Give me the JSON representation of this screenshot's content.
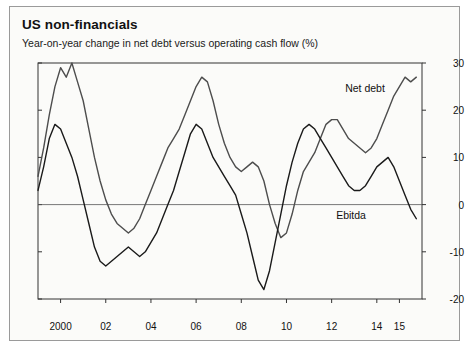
{
  "card": {
    "title": "US non-financials",
    "subtitle": "Year-on-year change in net debt versus operating cash flow (%)"
  },
  "chart_data": {
    "type": "line",
    "title": "US non-financials",
    "subtitle": "Year-on-year change in net debt versus operating cash flow (%)",
    "xlabel": "",
    "ylabel": "%",
    "ylim": [
      -20,
      30
    ],
    "yticks": [
      -20,
      -10,
      0,
      10,
      20,
      30
    ],
    "xlim": [
      1999.0,
      2016.0
    ],
    "xticks": [
      2000,
      2002,
      2004,
      2006,
      2008,
      2010,
      2012,
      2014,
      2015
    ],
    "xticklabels": [
      "2000",
      "02",
      "04",
      "06",
      "08",
      "10",
      "12",
      "14",
      "15"
    ],
    "grid": false,
    "zero_line": true,
    "legend": "inline-annotations",
    "series": [
      {
        "name": "Net debt",
        "color": "#4d4d4d",
        "label_x": 2012.6,
        "label_y": 24.5,
        "x": [
          1999.0,
          1999.25,
          1999.5,
          1999.75,
          2000.0,
          2000.25,
          2000.5,
          2000.75,
          2001.0,
          2001.25,
          2001.5,
          2001.75,
          2002.0,
          2002.25,
          2002.5,
          2002.75,
          2003.0,
          2003.25,
          2003.5,
          2003.75,
          2004.0,
          2004.25,
          2004.5,
          2004.75,
          2005.0,
          2005.25,
          2005.5,
          2005.75,
          2006.0,
          2006.25,
          2006.5,
          2006.75,
          2007.0,
          2007.25,
          2007.5,
          2007.75,
          2008.0,
          2008.25,
          2008.5,
          2008.75,
          2009.0,
          2009.25,
          2009.5,
          2009.75,
          2010.0,
          2010.25,
          2010.5,
          2010.75,
          2011.0,
          2011.25,
          2011.5,
          2011.75,
          2012.0,
          2012.25,
          2012.5,
          2012.75,
          2013.0,
          2013.25,
          2013.5,
          2013.75,
          2014.0,
          2014.25,
          2014.5,
          2014.75,
          2015.0,
          2015.25,
          2015.5,
          2015.75
        ],
        "y": [
          6,
          12,
          19,
          25,
          29,
          27,
          30,
          26,
          22,
          16,
          10,
          5,
          1,
          -2,
          -4,
          -5,
          -6,
          -5,
          -3,
          0,
          3,
          6,
          9,
          12,
          14,
          16,
          19,
          22,
          25,
          27,
          26,
          22,
          17,
          13,
          10,
          8,
          7,
          8,
          9,
          8,
          5,
          0,
          -4,
          -7,
          -6,
          -2,
          3,
          7,
          9,
          11,
          14,
          17,
          18,
          18,
          16,
          14,
          13,
          12,
          11,
          12,
          14,
          17,
          20,
          23,
          25,
          27,
          26,
          27
        ]
      },
      {
        "name": "Ebitda",
        "color": "#1a1a1a",
        "label_x": 2012.2,
        "label_y": -2.5,
        "x": [
          1999.0,
          1999.25,
          1999.5,
          1999.75,
          2000.0,
          2000.25,
          2000.5,
          2000.75,
          2001.0,
          2001.25,
          2001.5,
          2001.75,
          2002.0,
          2002.25,
          2002.5,
          2002.75,
          2003.0,
          2003.25,
          2003.5,
          2003.75,
          2004.0,
          2004.25,
          2004.5,
          2004.75,
          2005.0,
          2005.25,
          2005.5,
          2005.75,
          2006.0,
          2006.25,
          2006.5,
          2006.75,
          2007.0,
          2007.25,
          2007.5,
          2007.75,
          2008.0,
          2008.25,
          2008.5,
          2008.75,
          2009.0,
          2009.25,
          2009.5,
          2009.75,
          2010.0,
          2010.25,
          2010.5,
          2010.75,
          2011.0,
          2011.25,
          2011.5,
          2011.75,
          2012.0,
          2012.25,
          2012.5,
          2012.75,
          2013.0,
          2013.25,
          2013.5,
          2013.75,
          2014.0,
          2014.25,
          2014.5,
          2014.75,
          2015.0,
          2015.25,
          2015.5,
          2015.75
        ],
        "y": [
          3,
          8,
          14,
          17,
          16,
          13,
          10,
          6,
          1,
          -4,
          -9,
          -12,
          -13,
          -12,
          -11,
          -10,
          -9,
          -10,
          -11,
          -10,
          -8,
          -6,
          -3,
          0,
          3,
          7,
          11,
          15,
          17,
          16,
          13,
          10,
          8,
          6,
          4,
          2,
          -2,
          -6,
          -11,
          -16,
          -18,
          -14,
          -8,
          -2,
          4,
          9,
          13,
          16,
          17,
          16,
          14,
          12,
          10,
          8,
          6,
          4,
          3,
          3,
          4,
          6,
          8,
          9,
          10,
          8,
          5,
          2,
          -1,
          -3
        ]
      }
    ]
  }
}
